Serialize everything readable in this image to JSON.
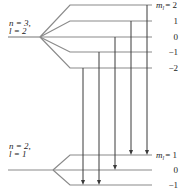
{
  "diagram": {
    "upper_level": {
      "n_label": "n = 3,",
      "l_label": "l = 2",
      "ml_prefix": "m",
      "ml_sub": "l",
      "sublevels": [
        {
          "ml": 2,
          "label": "= 2"
        },
        {
          "ml": 1,
          "label": "1"
        },
        {
          "ml": 0,
          "label": "0"
        },
        {
          "ml": -1,
          "label": "−1"
        },
        {
          "ml": -2,
          "label": "−2"
        }
      ]
    },
    "lower_level": {
      "n_label": "n = 2,",
      "l_label": "l = 1",
      "ml_prefix": "m",
      "ml_sub": "l",
      "sublevels": [
        {
          "ml": 1,
          "label": "= 1"
        },
        {
          "ml": 0,
          "label": "0"
        },
        {
          "ml": -1,
          "label": "−1"
        }
      ]
    },
    "transitions": [
      {
        "from_ml": -2,
        "to_ml": -1
      },
      {
        "from_ml": -1,
        "to_ml": -1
      },
      {
        "from_ml": 0,
        "to_ml": 0
      },
      {
        "from_ml": 1,
        "to_ml": 1
      },
      {
        "from_ml": 2,
        "to_ml": 1
      }
    ]
  }
}
